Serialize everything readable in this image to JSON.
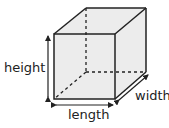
{
  "diagram": {
    "shape": "cube",
    "colors": {
      "face": "#ececec",
      "edge": "#222222"
    },
    "labels": {
      "height": "height",
      "length": "length",
      "width": "width"
    }
  }
}
